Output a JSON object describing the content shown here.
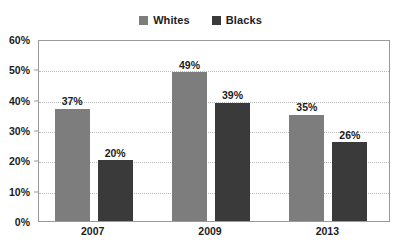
{
  "chart_data": {
    "type": "bar",
    "title": "",
    "subtitle": "",
    "xlabel": "",
    "ylabel": "",
    "categories": [
      "2007",
      "2009",
      "2013"
    ],
    "series": [
      {
        "name": "Whites",
        "color": "#7d7d7d",
        "values": [
          37,
          49,
          35
        ],
        "labels": [
          "37%",
          "49%",
          "35%"
        ]
      },
      {
        "name": "Blacks",
        "color": "#3a3a3a",
        "values": [
          20,
          39,
          26
        ],
        "labels": [
          "20%",
          "39%",
          "26%"
        ]
      }
    ],
    "ylim": [
      0,
      60
    ],
    "ytick_values": [
      0,
      10,
      20,
      30,
      40,
      50,
      60
    ],
    "ytick_labels": [
      "0%",
      "10%",
      "20%",
      "30%",
      "40%",
      "50%",
      "60%"
    ],
    "grid": true,
    "grid_color": "#b9b9b9",
    "legend_position": "top-center",
    "plot_border_color": "#9a9a9a",
    "background_color": "#ffffff",
    "value_labels_shown": true
  },
  "legend": {
    "entries": [
      {
        "label": "Whites",
        "swatch_color": "#7d7d7d"
      },
      {
        "label": "Blacks",
        "swatch_color": "#3a3a3a"
      }
    ]
  }
}
